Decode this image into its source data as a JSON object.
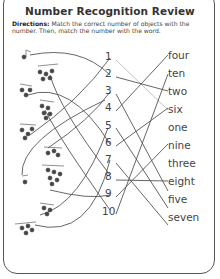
{
  "worksheet": {
    "title": "Number Recognition Review",
    "directions_label": "Directions:",
    "directions_text": "Match the correct number of objects with the number. Then, match the number with the word.",
    "numbers": [
      "1",
      "2",
      "3",
      "4",
      "5",
      "6",
      "7",
      "8",
      "9",
      "10"
    ],
    "words": [
      "four",
      "ten",
      "two",
      "six",
      "one",
      "nine",
      "three",
      "eight",
      "five",
      "seven"
    ],
    "object_icon": "music-notes-cluster",
    "border_color": "#555555",
    "line_color": "#555555"
  }
}
